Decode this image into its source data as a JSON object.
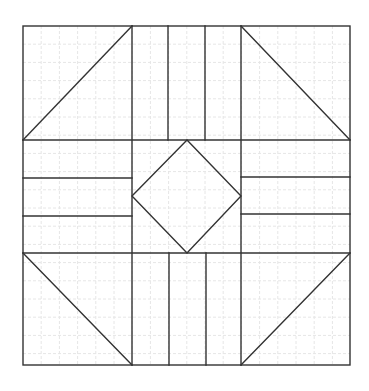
{
  "diagram": {
    "colors": {
      "line": "#333333",
      "grid": "#e6e6e6",
      "background": "#ffffff"
    },
    "outer": {
      "x1": 23,
      "y1": 26,
      "x2": 350,
      "y2": 365
    },
    "grid_spacing": 18.2,
    "columns": [
      23,
      132,
      241,
      350
    ],
    "rows": [
      26,
      140,
      253,
      365
    ],
    "segments": [
      {
        "name": "top-left-diagonal",
        "x1": 23,
        "y1": 140,
        "x2": 132,
        "y2": 26
      },
      {
        "name": "top-right-diagonal",
        "x1": 241,
        "y1": 26,
        "x2": 350,
        "y2": 140
      },
      {
        "name": "bottom-left-diagonal",
        "x1": 23,
        "y1": 253,
        "x2": 132,
        "y2": 365
      },
      {
        "name": "bottom-right-diagonal",
        "x1": 350,
        "y1": 253,
        "x2": 241,
        "y2": 365
      },
      {
        "name": "top-strip-line-1",
        "x1": 168,
        "y1": 26,
        "x2": 168,
        "y2": 140
      },
      {
        "name": "top-strip-line-2",
        "x1": 205,
        "y1": 26,
        "x2": 205,
        "y2": 140
      },
      {
        "name": "bottom-strip-line-1",
        "x1": 169,
        "y1": 253,
        "x2": 169,
        "y2": 365
      },
      {
        "name": "bottom-strip-line-2",
        "x1": 206,
        "y1": 253,
        "x2": 206,
        "y2": 365
      },
      {
        "name": "left-strip-line-1",
        "x1": 23,
        "y1": 178,
        "x2": 132,
        "y2": 178
      },
      {
        "name": "left-strip-line-2",
        "x1": 23,
        "y1": 216,
        "x2": 132,
        "y2": 216
      },
      {
        "name": "right-strip-line-1",
        "x1": 241,
        "y1": 177,
        "x2": 350,
        "y2": 177
      },
      {
        "name": "right-strip-line-2",
        "x1": 241,
        "y1": 214,
        "x2": 350,
        "y2": 214
      }
    ],
    "diamond": {
      "points": "187,140 241,196 187,253 132,196"
    }
  }
}
